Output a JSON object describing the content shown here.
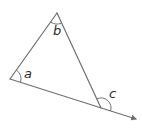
{
  "diagram": {
    "type": "triangle-exterior-angle",
    "colors": {
      "line": "#6f6f6f",
      "label": "#2a2a2a",
      "background": "#ffffff"
    },
    "vertices": {
      "top": {
        "x": 57,
        "y": 13
      },
      "left": {
        "x": 10,
        "y": 79
      },
      "right": {
        "x": 101,
        "y": 108
      }
    },
    "extension_end": {
      "x": 136,
      "y": 119
    },
    "angles": [
      {
        "id": "a",
        "label": "a",
        "at": "left",
        "kind": "interior"
      },
      {
        "id": "b",
        "label": "b",
        "at": "top",
        "kind": "interior"
      },
      {
        "id": "c",
        "label": "c",
        "at": "right",
        "kind": "exterior"
      }
    ]
  }
}
